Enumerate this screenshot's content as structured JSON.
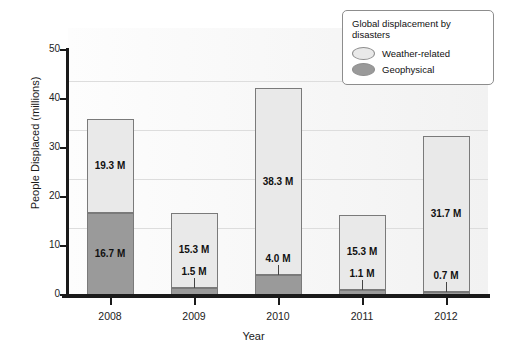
{
  "chart_data": {
    "type": "bar",
    "subtype": "stacked",
    "title": "",
    "xlabel": "Year",
    "ylabel": "People Displaced (millions)",
    "categories": [
      "2008",
      "2009",
      "2010",
      "2011",
      "2012"
    ],
    "ylim": [
      0,
      50
    ],
    "yticks": [
      "0",
      "10",
      "20",
      "30",
      "40",
      "50"
    ],
    "grid": true,
    "legend_position": "top-right",
    "series": [
      {
        "name": "Geophysical",
        "color": "#9a9a9a",
        "values": [
          16.7,
          1.5,
          4.0,
          1.1,
          0.7
        ],
        "labels": [
          "16.7 M",
          "1.5 M",
          "4.0 M",
          "1.1 M",
          "0.7 M"
        ]
      },
      {
        "name": "Weather-related",
        "color": "#e9e9e9",
        "values": [
          19.3,
          15.3,
          38.3,
          15.3,
          31.7
        ],
        "labels": [
          "19.3 M",
          "15.3 M",
          "38.3 M",
          "15.3 M",
          "31.7 M"
        ]
      }
    ],
    "totals": [
      36.0,
      16.8,
      42.3,
      16.4,
      32.4
    ]
  },
  "legend": {
    "title": "Global displacement by disasters",
    "entries": [
      {
        "label": "Weather-related",
        "color": "#e9e9e9"
      },
      {
        "label": "Geophysical",
        "color": "#9a9a9a"
      }
    ]
  },
  "axes": {
    "y_title": "People Displaced (millions)",
    "x_title": "Year",
    "y_ticks": [
      "50",
      "40",
      "30",
      "20",
      "10",
      "0"
    ],
    "x_ticks": [
      "2008",
      "2009",
      "2010",
      "2011",
      "2012"
    ]
  },
  "colors": {
    "weather": "#e9e9e9",
    "geophysical": "#9a9a9a",
    "axis": "#1a1a1a",
    "grid": "#dddddd",
    "plot_background": "#f7f7f7"
  }
}
